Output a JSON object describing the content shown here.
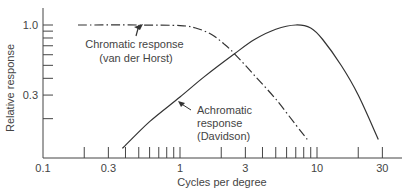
{
  "chart_data": {
    "type": "line",
    "title": "",
    "xlabel": "Cycles per degree",
    "ylabel": "Relative response",
    "xscale": "log",
    "yscale": "log",
    "xlim": [
      0.1,
      40
    ],
    "ylim": [
      0.1,
      1.3
    ],
    "grid": false,
    "legend": "none (inline annotations)",
    "x_ticks": [
      0.1,
      0.3,
      1,
      3,
      10,
      30
    ],
    "x_tick_labels": [
      "0.1",
      "0.3",
      "1",
      "3",
      "10",
      "30"
    ],
    "x_minor_ticks": [
      0.2,
      0.4,
      0.5,
      0.6,
      0.7,
      0.8,
      0.9,
      2,
      4,
      5,
      6,
      7,
      8,
      9,
      20
    ],
    "y_ticks": [
      0.3,
      1.0
    ],
    "y_tick_labels": [
      "0.3",
      "1.0"
    ],
    "y_minor_ticks": [
      0.2,
      0.4,
      0.5,
      0.6,
      0.7,
      0.8,
      0.9
    ],
    "series": [
      {
        "name": "Chromatic response (van der Horst)",
        "style": "dash-dot",
        "x": [
          0.18,
          0.5,
          1.0,
          1.3,
          1.7,
          2.1,
          2.5,
          3.5,
          5,
          7,
          8.5
        ],
        "values": [
          1.0,
          1.0,
          0.99,
          0.95,
          0.85,
          0.72,
          0.61,
          0.42,
          0.28,
          0.18,
          0.14
        ]
      },
      {
        "name": "Achromatic response (Davidson)",
        "style": "solid",
        "x": [
          0.38,
          0.6,
          1,
          1.5,
          2.5,
          3.5,
          5,
          7,
          9,
          11,
          15,
          20,
          28
        ],
        "values": [
          0.12,
          0.19,
          0.29,
          0.41,
          0.61,
          0.78,
          0.93,
          1.0,
          0.95,
          0.78,
          0.5,
          0.3,
          0.14
        ]
      }
    ],
    "annotations": [
      {
        "lines": [
          "Chromatic response",
          "(van der Horst)"
        ],
        "points_to": "Chromatic response"
      },
      {
        "lines": [
          "Achromatic",
          "response",
          "(Davidson)"
        ],
        "points_to": "Achromatic response"
      }
    ]
  }
}
